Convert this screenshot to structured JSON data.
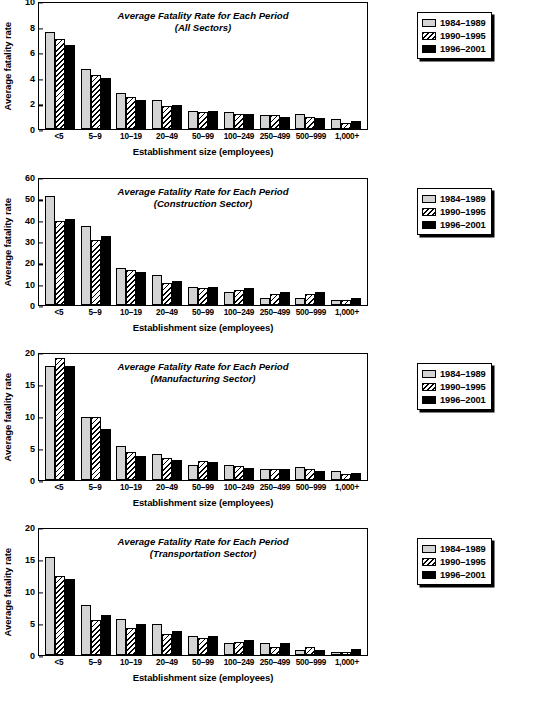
{
  "legend": {
    "entries": [
      {
        "label": "1984–1989",
        "swatch": "light-gray-swatch"
      },
      {
        "label": "1990–1995",
        "swatch": "hatched-swatch"
      },
      {
        "label": "1996–2001",
        "swatch": "black-swatch"
      }
    ]
  },
  "common": {
    "ylabel": "Average fatality rate",
    "xlabel": "Establishment size (employees)",
    "title_line1": "Average Fatality Rate for Each Period",
    "categories": [
      "<5",
      "5–9",
      "10–19",
      "20–49",
      "50–99",
      "100–249",
      "250–499",
      "500–999",
      "1,000+"
    ]
  },
  "chart_data": [
    {
      "type": "bar",
      "id": "all-sectors",
      "title": "Average Fatality Rate for Each Period",
      "subtitle": "(All Sectors)",
      "xlabel": "Establishment size (employees)",
      "ylabel": "Average fatality rate",
      "categories": [
        "<5",
        "5–9",
        "10–19",
        "20–49",
        "50–99",
        "100–249",
        "250–499",
        "500–999",
        "1,000+"
      ],
      "ylim": [
        0,
        10
      ],
      "yticks": [
        0,
        2,
        4,
        6,
        8,
        10
      ],
      "grid": false,
      "legend_position": "outside-right-top",
      "series": [
        {
          "name": "1984–1989",
          "values": [
            7.6,
            4.7,
            2.85,
            2.3,
            1.4,
            1.3,
            1.1,
            1.2,
            0.75
          ]
        },
        {
          "name": "1990–1995",
          "values": [
            7.05,
            4.2,
            2.5,
            1.8,
            1.35,
            1.2,
            1.1,
            0.95,
            0.45
          ]
        },
        {
          "name": "1996–2001",
          "values": [
            6.6,
            4.0,
            2.25,
            1.85,
            1.4,
            1.2,
            0.95,
            0.85,
            0.6
          ]
        }
      ]
    },
    {
      "type": "bar",
      "id": "construction-sector",
      "title": "Average Fatality Rate for Each Period",
      "subtitle": "(Construction Sector)",
      "xlabel": "Establishment size (employees)",
      "ylabel": "Average fatality rate",
      "categories": [
        "<5",
        "5–9",
        "10–19",
        "20–49",
        "50–99",
        "100–249",
        "250–499",
        "500–999",
        "1,000+"
      ],
      "ylim": [
        0,
        60
      ],
      "yticks": [
        0,
        10,
        20,
        30,
        40,
        50,
        60
      ],
      "grid": false,
      "legend_position": "outside-right-top",
      "series": [
        {
          "name": "1984–1989",
          "values": [
            51.0,
            37.0,
            17.3,
            13.9,
            8.5,
            6.1,
            3.2,
            3.2,
            2.2
          ]
        },
        {
          "name": "1990–1995",
          "values": [
            39.5,
            30.6,
            16.4,
            10.3,
            7.8,
            7.0,
            5.3,
            5.2,
            2.3
          ]
        },
        {
          "name": "1996–2001",
          "values": [
            40.3,
            32.4,
            15.6,
            11.2,
            8.5,
            7.8,
            6.1,
            6.0,
            3.2
          ]
        }
      ]
    },
    {
      "type": "bar",
      "id": "manufacturing-sector",
      "title": "Average Fatality Rate for Each Period",
      "subtitle": "(Manufacturing Sector)",
      "xlabel": "Establishment size (employees)",
      "ylabel": "Average fatality rate",
      "categories": [
        "<5",
        "5–9",
        "10–19",
        "20–49",
        "50–99",
        "100–249",
        "250–499",
        "500–999",
        "1,000+"
      ],
      "ylim": [
        0,
        20
      ],
      "yticks": [
        0,
        5,
        10,
        15,
        20
      ],
      "grid": false,
      "legend_position": "outside-right-top",
      "series": [
        {
          "name": "1984–1989",
          "values": [
            17.8,
            9.8,
            5.3,
            4.1,
            2.3,
            2.3,
            1.7,
            2.0,
            1.4
          ]
        },
        {
          "name": "1990–1995",
          "values": [
            19.1,
            9.8,
            4.4,
            3.4,
            2.9,
            2.2,
            1.7,
            1.7,
            1.0
          ]
        },
        {
          "name": "1996–2001",
          "values": [
            17.8,
            7.9,
            3.8,
            3.2,
            2.85,
            1.95,
            1.7,
            1.35,
            1.1
          ]
        }
      ]
    },
    {
      "type": "bar",
      "id": "transportation-sector",
      "title": "Average Fatality Rate for Each Period",
      "subtitle": "(Transportation Sector)",
      "xlabel": "Establishment size (employees)",
      "ylabel": "Average fatality rate",
      "categories": [
        "<5",
        "5–9",
        "10–19",
        "20–49",
        "50–99",
        "100–249",
        "250–499",
        "500–999",
        "1,000+"
      ],
      "ylim": [
        0,
        20
      ],
      "yticks": [
        0,
        5,
        10,
        15,
        20
      ],
      "grid": false,
      "legend_position": "outside-right-top",
      "series": [
        {
          "name": "1984–1989",
          "values": [
            15.3,
            7.8,
            5.6,
            4.9,
            3.0,
            1.8,
            1.8,
            0.85,
            0.5
          ]
        },
        {
          "name": "1990–1995",
          "values": [
            12.3,
            5.4,
            4.2,
            3.3,
            2.7,
            2.1,
            1.2,
            1.2,
            0.5
          ]
        },
        {
          "name": "1996–2001",
          "values": [
            11.9,
            6.2,
            4.8,
            3.8,
            3.0,
            2.4,
            1.8,
            0.85,
            0.95
          ]
        }
      ]
    }
  ]
}
